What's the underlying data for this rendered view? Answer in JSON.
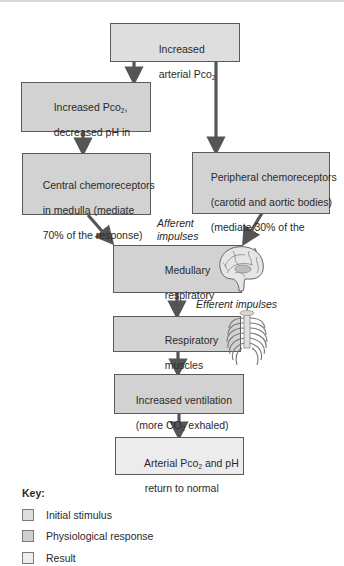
{
  "diagram": {
    "boxes": [
      {
        "id": "increased-arterial-pco2",
        "type": "initial_stimulus",
        "line1": "Increased",
        "line2": "arterial Pco",
        "line2_sub": "2"
      },
      {
        "id": "csf-change",
        "type": "physiological_response",
        "line1": "Increased Pco",
        "line1_sub": "2",
        "line1_end": ",",
        "line2": "decreased pH in",
        "line3": "cerebrospinal fluid"
      },
      {
        "id": "central-chemoreceptors",
        "type": "physiological_response",
        "line1": "Central chemoreceptors",
        "line2": "in medulla (mediate",
        "line3": "70% of the response)"
      },
      {
        "id": "peripheral-chemoreceptors",
        "type": "physiological_response",
        "line1": "Peripheral chemoreceptors",
        "line2": "(carotid and aortic bodies)",
        "line3": "(mediate 30% of the",
        "line4": "response)"
      },
      {
        "id": "medullary-centers",
        "type": "physiological_response",
        "line1": "Medullary",
        "line2": "respiratory",
        "line3": "centers"
      },
      {
        "id": "respiratory-muscles",
        "type": "physiological_response",
        "line1": "Respiratory",
        "line2": "muscles"
      },
      {
        "id": "increased-ventilation",
        "type": "physiological_response",
        "line1": "Increased ventilation",
        "line2": "(more CO",
        "line2_sub": "2",
        "line2_end": " exhaled)"
      },
      {
        "id": "return-to-normal",
        "type": "result",
        "line1": "Arterial Pco",
        "line1_sub": "2",
        "line1_end": " and pH",
        "line2": "return to normal"
      }
    ],
    "labels": {
      "afferent_line1": "Afferent",
      "afferent_line2": "impulses",
      "efferent": "Efferent impulses"
    },
    "illustrations": [
      "brain-icon",
      "ribcage-icon"
    ]
  },
  "key": {
    "title": "Key:",
    "items": [
      {
        "label": "Initial stimulus",
        "color": "#dedede"
      },
      {
        "label": "Physiological response",
        "color": "#d2d2d2"
      },
      {
        "label": "Result",
        "color": "#ececec"
      }
    ]
  },
  "colors": {
    "arrow": "#555555",
    "border": "#5a5a5a"
  }
}
